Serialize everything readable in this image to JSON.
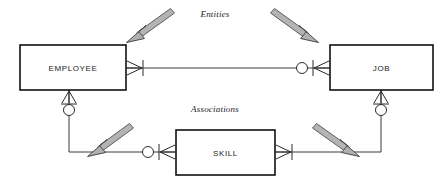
{
  "diagram": {
    "type": "entity-relationship-diagram",
    "notation": "crow's foot",
    "canvas": {
      "width": 446,
      "height": 191,
      "background": "#ffffff"
    },
    "colors": {
      "entity_stroke": "#111111",
      "entity_fill": "#ffffff",
      "line": "#3a3a3a",
      "callout_fill": "#b0b0b0",
      "callout_stroke": "#4a4a4a",
      "text": "#1a1a1a"
    },
    "entities": [
      {
        "id": "employee",
        "label": "EMPLOYEE",
        "x": 20,
        "y": 45,
        "width": 106,
        "height": 45
      },
      {
        "id": "job",
        "label": "JOB",
        "x": 330,
        "y": 45,
        "width": 103,
        "height": 45
      },
      {
        "id": "skill",
        "label": "SKILL",
        "x": 176,
        "y": 130,
        "width": 99,
        "height": 45
      }
    ],
    "relationships": [
      {
        "id": "employee-job",
        "from": "employee",
        "to": "job",
        "from_cardinality": "many-one",
        "to_cardinality": "zero-or-many"
      },
      {
        "id": "employee-skill",
        "from": "employee",
        "to": "skill",
        "from_cardinality": "many-zero",
        "to_cardinality": "zero-or-many"
      },
      {
        "id": "skill-job",
        "from": "skill",
        "to": "job",
        "from_cardinality": "many-one",
        "to_cardinality": "many-zero"
      }
    ],
    "callouts": [
      {
        "id": "entities",
        "label": "Entities",
        "label_x": 215,
        "label_y": 15,
        "arrows": [
          {
            "id": "entities-arrow-left",
            "x1": 172,
            "y1": 11,
            "x2": 127,
            "y2": 43,
            "direction": "down-left"
          },
          {
            "id": "entities-arrow-right",
            "x1": 273,
            "y1": 11,
            "x2": 318,
            "y2": 43,
            "direction": "down-right"
          }
        ]
      },
      {
        "id": "associations",
        "label": "Associations",
        "label_x": 215,
        "label_y": 110,
        "arrows": [
          {
            "id": "associations-arrow-left",
            "x1": 131,
            "y1": 126,
            "x2": 88,
            "y2": 157,
            "direction": "down-left"
          },
          {
            "id": "associations-arrow-right",
            "x1": 315,
            "y1": 126,
            "x2": 359,
            "y2": 157,
            "direction": "down-right"
          }
        ]
      }
    ]
  }
}
